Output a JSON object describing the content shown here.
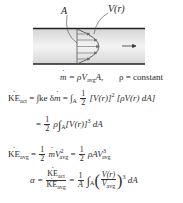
{
  "figure": {
    "label_area": "A",
    "label_velocity": "V(r)",
    "colors": {
      "wall": "#222222",
      "fluid": "#e8e8e8",
      "profile": "#555555"
    }
  },
  "equations": {
    "mass_flow": {
      "lhs": "m",
      "rhs_pre": "= ρV",
      "rhs_sub": "avg",
      "rhs_post": "A,",
      "condition": "ρ = constant"
    },
    "ke_act": {
      "lhs": "KE",
      "lhs_sub": "act",
      "part1": "= ∫ke δ",
      "part1_m": "m",
      "part2": " = ∫",
      "part2_sub": "A",
      "half_num": "1",
      "half_den": "2",
      "part3": "[V(r)]",
      "part3_sup": "2",
      "part4": " [ρV(r) dA]"
    },
    "ke_act_simplified": {
      "pre": "=",
      "half_num": "1",
      "half_den": "2",
      "rho": "ρ",
      "integral_sub": "A",
      "body": "[V(r)]",
      "sup": "3",
      "post": " dA"
    },
    "ke_avg": {
      "lhs": "KE",
      "lhs_sub": "avg",
      "eq1": "=",
      "half_num": "1",
      "half_den": "2",
      "m": "m",
      "v": "V",
      "v_sup": "2",
      "v_sub": "avg",
      "eq2": "=",
      "half2_num": "1",
      "half2_den": "2",
      "term": "ρAV",
      "term_sup": "3",
      "term_sub": "avg"
    },
    "alpha": {
      "lhs": "α =",
      "frac_num": "KE",
      "frac_num_sub": "act",
      "frac_den": "KE",
      "frac_den_sub": "avg",
      "eq": "=",
      "inv_num": "1",
      "inv_den": "A",
      "integral_sub": "A",
      "ratio_num": "V(r)",
      "ratio_den": "V",
      "ratio_den_sub": "avg",
      "sup": "3",
      "post": "dA"
    }
  }
}
